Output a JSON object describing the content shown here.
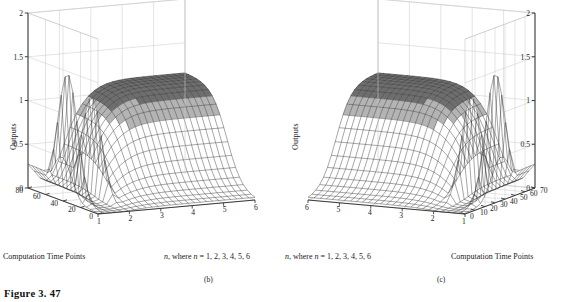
{
  "figure": {
    "caption": "Figure 3. 47",
    "panels": [
      {
        "id": "b",
        "sublabel": "(b)",
        "orientation": "left",
        "axis_captions": {
          "depth": "Computation Time Points",
          "horizontal_prefix": "n",
          "horizontal_rest": ", where ",
          "horizontal_var": "n",
          "horizontal_values": " = 1, 2, 3, 4, 5, 6"
        },
        "ylabel": "Outputs"
      },
      {
        "id": "c",
        "sublabel": "(c)",
        "orientation": "right",
        "axis_captions": {
          "depth": "Computation Time Points",
          "horizontal_prefix": "n",
          "horizontal_rest": ", where ",
          "horizontal_var": "n",
          "horizontal_values": " = 1, 2, 3, 4, 5, 6"
        },
        "ylabel": "Outputs"
      }
    ]
  },
  "chart_data": [
    {
      "type": "line",
      "subplot": "b",
      "title": "",
      "xlabel": "n, where n = 1, 2, 3, 4, 5, 6",
      "ylabel": "Outputs",
      "zlabel": "Computation Time Points",
      "projection": "3d-mesh-surface",
      "grid": true,
      "legend": "none",
      "x_axis": {
        "name": "n",
        "ticks": [
          1,
          2,
          3,
          4,
          5,
          6
        ],
        "xlim": [
          1,
          6
        ],
        "direction": "left-to-right"
      },
      "z_axis": {
        "name": "Computation Time Points",
        "ticks": [
          80,
          60,
          40,
          20,
          0
        ],
        "zlim": [
          0,
          80
        ],
        "direction": "back-to-front"
      },
      "y_axis": {
        "name": "Outputs",
        "ticks": [
          0,
          0.5,
          1,
          1.5,
          2
        ],
        "ylim": [
          0,
          2
        ]
      },
      "surface_description": "Two tall narrow spikes near n=1 and n=2 rising to about 1.55 and 1.25, with a broad smooth plateau at about 1.15 extending over n=3 to n=6 that rolls off toward the front (low computation time points).",
      "peaks": [
        {
          "n": 1.15,
          "t": 46,
          "output": 1.55
        },
        {
          "n": 2.0,
          "t": 40,
          "output": 1.22
        }
      ],
      "plateau": {
        "n_range": [
          3,
          6
        ],
        "t_range": [
          30,
          80
        ],
        "output": 1.15
      },
      "mesh": {
        "n_lines": 26,
        "t_lines": 19
      },
      "series": [
        {
          "name": "n=1",
          "values": [
            0.02,
            0.05,
            0.12,
            0.35,
            0.95,
            1.52,
            1.4,
            0.82,
            0.35,
            0.1,
            0.03
          ]
        },
        {
          "name": "n=2",
          "values": [
            0.02,
            0.04,
            0.1,
            0.28,
            0.78,
            1.22,
            1.1,
            0.66,
            0.28,
            0.08,
            0.02
          ]
        },
        {
          "name": "n=3",
          "values": [
            0.04,
            0.12,
            0.34,
            0.66,
            0.95,
            1.12,
            1.15,
            1.15,
            1.15,
            1.15,
            1.15
          ]
        },
        {
          "name": "n=4",
          "values": [
            0.05,
            0.14,
            0.38,
            0.7,
            0.98,
            1.13,
            1.16,
            1.16,
            1.16,
            1.16,
            1.16
          ]
        },
        {
          "name": "n=5",
          "values": [
            0.05,
            0.15,
            0.4,
            0.72,
            1.0,
            1.14,
            1.16,
            1.16,
            1.16,
            1.16,
            1.16
          ]
        },
        {
          "name": "n=6",
          "values": [
            0.05,
            0.15,
            0.4,
            0.72,
            1.0,
            1.14,
            1.16,
            1.16,
            1.16,
            1.16,
            1.16
          ]
        }
      ],
      "t_samples": [
        0,
        8,
        16,
        24,
        32,
        40,
        48,
        56,
        64,
        72,
        80
      ]
    },
    {
      "type": "line",
      "subplot": "c",
      "title": "",
      "xlabel": "n, where n = 1, 2, 3, 4, 5, 6",
      "ylabel": "Outputs",
      "zlabel": "Computation Time Points",
      "projection": "3d-mesh-surface",
      "grid": true,
      "legend": "none",
      "x_axis": {
        "name": "n",
        "ticks": [
          6,
          5,
          4,
          3,
          2,
          1
        ],
        "xlim": [
          1,
          6
        ],
        "direction": "right-to-left"
      },
      "z_axis": {
        "name": "Computation Time Points",
        "ticks": [
          0,
          10,
          20,
          30,
          40,
          50,
          60,
          70
        ],
        "zlim": [
          0,
          70
        ],
        "direction": "front-to-back"
      },
      "y_axis": {
        "name": "Outputs",
        "ticks": [
          0,
          0.5,
          1,
          1.5,
          2
        ],
        "ylim": [
          0,
          2
        ]
      },
      "surface_description": "Mirror image of panel (b): broad smooth plateau at about 1.15 on the left over n=6 to n=3, and two tall narrow spikes near n=2 and n=1 on the right rising to about 1.25 and 1.55.",
      "peaks": [
        {
          "n": 2.0,
          "t": 30,
          "output": 1.25
        },
        {
          "n": 1.15,
          "t": 36,
          "output": 1.55
        }
      ],
      "plateau": {
        "n_range": [
          3,
          6
        ],
        "t_range": [
          25,
          70
        ],
        "output": 1.15
      },
      "mesh": {
        "n_lines": 26,
        "t_lines": 19
      },
      "series": [
        {
          "name": "n=6",
          "values": [
            0.05,
            0.15,
            0.4,
            0.72,
            1.0,
            1.14,
            1.16,
            1.16,
            1.16,
            1.16,
            1.16
          ]
        },
        {
          "name": "n=5",
          "values": [
            0.05,
            0.15,
            0.4,
            0.72,
            1.0,
            1.14,
            1.16,
            1.16,
            1.16,
            1.16,
            1.16
          ]
        },
        {
          "name": "n=4",
          "values": [
            0.05,
            0.14,
            0.38,
            0.7,
            0.98,
            1.13,
            1.16,
            1.16,
            1.16,
            1.16,
            1.16
          ]
        },
        {
          "name": "n=3",
          "values": [
            0.04,
            0.12,
            0.34,
            0.66,
            0.95,
            1.12,
            1.15,
            1.15,
            1.15,
            1.15,
            1.15
          ]
        },
        {
          "name": "n=2",
          "values": [
            0.02,
            0.04,
            0.1,
            0.28,
            0.78,
            1.22,
            1.1,
            0.66,
            0.28,
            0.08,
            0.02
          ]
        },
        {
          "name": "n=1",
          "values": [
            0.02,
            0.05,
            0.12,
            0.35,
            0.95,
            1.52,
            1.4,
            0.82,
            0.35,
            0.1,
            0.03
          ]
        }
      ],
      "t_samples": [
        0,
        7,
        14,
        21,
        28,
        35,
        42,
        49,
        56,
        63,
        70
      ]
    }
  ],
  "style": {
    "mesh_color": "#2b2b2b",
    "grid_color": "#c9c9c9",
    "axis_color": "#3a3a3a",
    "plateau_fill": "#6e6e6e",
    "background": "#ffffff"
  }
}
